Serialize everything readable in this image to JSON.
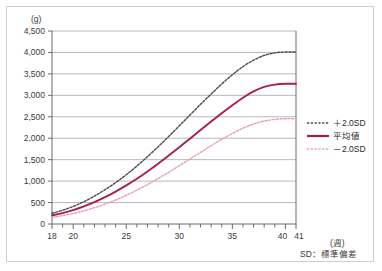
{
  "figure": {
    "y_unit": "(g)",
    "x_unit": "(週)",
    "footnote": "SD：標準偏差"
  },
  "legend": {
    "items": [
      {
        "label": "＋2.0SD",
        "color": "#4a4a52",
        "style": "dashed"
      },
      {
        "label": "平均値",
        "color": "#a81f4a",
        "style": "solid"
      },
      {
        "label": "－2.0SD",
        "color": "#e8a0b8",
        "style": "dashed"
      }
    ]
  },
  "chart_data": {
    "type": "line",
    "title": "",
    "subtitle": "",
    "xlabel": "(週)",
    "ylabel": "(g)",
    "xlim": [
      18,
      41
    ],
    "ylim": [
      0,
      4500
    ],
    "ytick_step": 500,
    "grid": true,
    "legend_position": "right",
    "annotations": [
      "SD：標準偏差"
    ],
    "ytick_labels": [
      "0",
      "500",
      "1,000",
      "1,500",
      "2,000",
      "2,500",
      "3,000",
      "3,500",
      "4,000",
      "4,500"
    ],
    "ytick_values": [
      0,
      500,
      1000,
      1500,
      2000,
      2500,
      3000,
      3500,
      4000,
      4500
    ],
    "xtick_labels": [
      "18",
      "20",
      "25",
      "30",
      "35",
      "40",
      "41"
    ],
    "xtick_values": [
      18,
      20,
      25,
      30,
      35,
      40,
      41
    ],
    "xtick_minor": [
      19,
      21,
      22,
      23,
      24,
      26,
      27,
      28,
      29,
      31,
      32,
      33,
      34,
      36,
      37,
      38,
      39
    ],
    "x": [
      18,
      19,
      20,
      21,
      22,
      23,
      24,
      25,
      26,
      27,
      28,
      29,
      30,
      31,
      32,
      33,
      34,
      35,
      36,
      37,
      38,
      39,
      40,
      41
    ],
    "series": [
      {
        "name": "＋2.0SD",
        "color": "#4a4a52",
        "style": "dashed",
        "values": [
          250,
          320,
          410,
          520,
          650,
          800,
          965,
          1150,
          1350,
          1570,
          1800,
          2040,
          2290,
          2540,
          2790,
          3030,
          3265,
          3480,
          3670,
          3820,
          3930,
          3990,
          4010,
          4010
        ]
      },
      {
        "name": "平均値",
        "color": "#a81f4a",
        "style": "solid",
        "values": [
          200,
          255,
          325,
          410,
          510,
          625,
          755,
          900,
          1055,
          1225,
          1405,
          1595,
          1790,
          1990,
          2190,
          2390,
          2585,
          2770,
          2945,
          3090,
          3195,
          3250,
          3270,
          3270
        ]
      },
      {
        "name": "－2.0SD",
        "color": "#e8a0b8",
        "style": "dashed",
        "values": [
          155,
          195,
          245,
          305,
          380,
          465,
          560,
          670,
          790,
          920,
          1060,
          1205,
          1360,
          1515,
          1670,
          1825,
          1975,
          2110,
          2235,
          2330,
          2400,
          2440,
          2455,
          2455
        ]
      }
    ]
  }
}
